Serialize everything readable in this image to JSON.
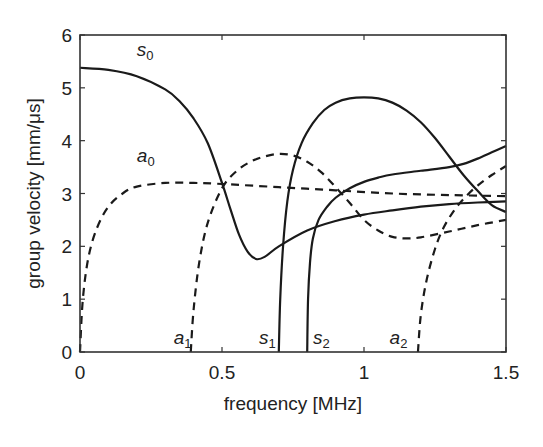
{
  "chart_data": {
    "type": "line",
    "title": "",
    "xlabel": "frequency [MHz]",
    "ylabel": "group velocity [mm/μs]",
    "xlim": [
      0,
      1.5
    ],
    "ylim": [
      0,
      6
    ],
    "xticks": [
      0,
      0.5,
      1,
      1.5
    ],
    "xtick_labels": [
      "0",
      "0.5",
      "1",
      "1.5"
    ],
    "yticks": [
      0,
      1,
      2,
      3,
      4,
      5,
      6
    ],
    "ytick_labels": [
      "0",
      "1",
      "2",
      "3",
      "4",
      "5",
      "6"
    ],
    "grid": false,
    "legend": "none (inline curve labels)",
    "series": [
      {
        "name": "s0",
        "label_base": "s",
        "label_sub": "0",
        "style": "solid",
        "label_pos": [
          0.2,
          5.6
        ],
        "x": [
          0,
          0.1,
          0.2,
          0.3,
          0.35,
          0.4,
          0.45,
          0.5,
          0.53,
          0.56,
          0.59,
          0.62,
          0.65,
          0.7,
          0.8,
          0.9,
          1.0,
          1.1,
          1.2,
          1.3,
          1.4,
          1.5
        ],
        "y": [
          5.38,
          5.34,
          5.22,
          4.97,
          4.75,
          4.42,
          3.95,
          3.2,
          2.7,
          2.22,
          1.9,
          1.76,
          1.8,
          2.0,
          2.3,
          2.48,
          2.6,
          2.68,
          2.75,
          2.8,
          2.83,
          2.85
        ]
      },
      {
        "name": "a0",
        "label_base": "a",
        "label_sub": "0",
        "style": "dashed",
        "label_pos": [
          0.2,
          3.6
        ],
        "x": [
          0,
          0.01,
          0.03,
          0.06,
          0.1,
          0.15,
          0.2,
          0.3,
          0.4,
          0.5,
          0.7,
          0.9,
          1.1,
          1.3,
          1.5
        ],
        "y": [
          0,
          1.0,
          1.8,
          2.35,
          2.75,
          3.0,
          3.13,
          3.2,
          3.2,
          3.18,
          3.12,
          3.06,
          3.0,
          2.97,
          2.95
        ]
      },
      {
        "name": "a1",
        "label_base": "a",
        "label_sub": "1",
        "style": "dashed",
        "label_pos": [
          0.33,
          0.15
        ],
        "x": [
          0.39,
          0.4,
          0.42,
          0.45,
          0.5,
          0.55,
          0.6,
          0.65,
          0.7,
          0.75,
          0.8,
          0.85,
          0.9,
          0.95,
          1.0,
          1.05,
          1.1,
          1.15,
          1.2,
          1.3,
          1.4,
          1.5
        ],
        "y": [
          0,
          0.8,
          1.7,
          2.45,
          3.1,
          3.42,
          3.6,
          3.7,
          3.75,
          3.72,
          3.6,
          3.4,
          3.12,
          2.82,
          2.5,
          2.3,
          2.18,
          2.15,
          2.17,
          2.28,
          2.4,
          2.5
        ]
      },
      {
        "name": "s1",
        "label_base": "s",
        "label_sub": "1",
        "style": "solid",
        "label_pos": [
          0.63,
          0.15
        ],
        "x": [
          0.7,
          0.705,
          0.715,
          0.73,
          0.75,
          0.78,
          0.82,
          0.86,
          0.9,
          0.95,
          1.0,
          1.05,
          1.1,
          1.15,
          1.2,
          1.25,
          1.3,
          1.35,
          1.4,
          1.45,
          1.5
        ],
        "y": [
          0,
          1.0,
          2.0,
          2.85,
          3.45,
          3.95,
          4.33,
          4.58,
          4.72,
          4.8,
          4.82,
          4.8,
          4.72,
          4.57,
          4.35,
          4.05,
          3.7,
          3.35,
          3.05,
          2.78,
          2.65
        ]
      },
      {
        "name": "s2",
        "label_base": "s",
        "label_sub": "2",
        "style": "solid",
        "label_pos": [
          0.82,
          0.15
        ],
        "x": [
          0.8,
          0.803,
          0.81,
          0.82,
          0.84,
          0.87,
          0.9,
          0.95,
          1.0,
          1.05,
          1.1,
          1.2,
          1.3,
          1.35,
          1.4,
          1.45,
          1.5
        ],
        "y": [
          0,
          1.0,
          1.7,
          2.15,
          2.5,
          2.75,
          2.92,
          3.1,
          3.22,
          3.3,
          3.36,
          3.43,
          3.5,
          3.56,
          3.66,
          3.78,
          3.9
        ]
      },
      {
        "name": "a2",
        "label_base": "a",
        "label_sub": "2",
        "style": "dashed",
        "label_pos": [
          1.09,
          0.15
        ],
        "x": [
          1.19,
          1.2,
          1.22,
          1.25,
          1.28,
          1.32,
          1.36,
          1.4,
          1.45,
          1.5
        ],
        "y": [
          0,
          0.7,
          1.35,
          1.95,
          2.35,
          2.7,
          2.95,
          3.15,
          3.35,
          3.52
        ]
      }
    ]
  },
  "layout": {
    "plot_left_px": 80,
    "plot_right_px": 506,
    "plot_top_px": 35,
    "plot_bottom_px": 352,
    "line_color": "#1a1a1a",
    "axis_color": "#333333"
  }
}
